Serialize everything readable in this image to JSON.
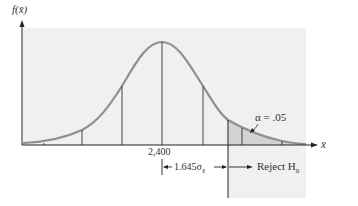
{
  "diagram": {
    "type": "normal-distribution-rejection-region",
    "y_axis_label": "f(x̄)",
    "x_axis_label": "x̄",
    "mean_label": "2,400",
    "alpha_label": "α = .05",
    "distance_label": "1.645σ",
    "distance_subscript": "x̄",
    "reject_label": "Reject H",
    "reject_subscript": "0",
    "colors": {
      "curve": "#8a8a8a",
      "panel": "#f0f0f0",
      "tail": "#d6d6d6",
      "axis": "#222222",
      "lines": "#333333"
    }
  }
}
